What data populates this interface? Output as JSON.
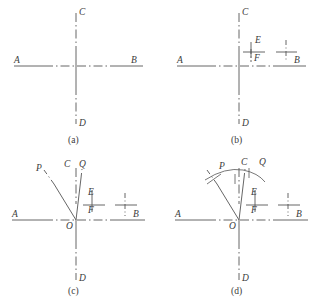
{
  "figure": {
    "stroke_color": "#555555",
    "text_color": "#3a3a3a",
    "background_color": "#ffffff",
    "panels": [
      {
        "id": "a",
        "caption": "(a)",
        "labels": {
          "left_axis": "A",
          "right_axis": "B",
          "top_axis": "C",
          "bottom_axis": "D"
        }
      },
      {
        "id": "b",
        "caption": "(b)",
        "labels": {
          "left_axis": "A",
          "right_axis": "B",
          "top_axis": "C",
          "bottom_axis": "D",
          "mark_upper": "E",
          "mark_lower": "F"
        }
      },
      {
        "id": "c",
        "caption": "(c)",
        "labels": {
          "left_axis": "A",
          "right_axis": "B",
          "top_axis": "C",
          "bottom_axis": "D",
          "mark_upper": "E",
          "mark_lower": "F",
          "ray_left": "P",
          "ray_right": "Q",
          "origin": "O"
        }
      },
      {
        "id": "d",
        "caption": "(d)",
        "labels": {
          "left_axis": "A",
          "right_axis": "B",
          "top_axis": "C",
          "bottom_axis": "D",
          "mark_upper": "E",
          "mark_lower": "F",
          "ray_left": "P",
          "ray_right": "Q",
          "origin": "O"
        }
      }
    ]
  }
}
